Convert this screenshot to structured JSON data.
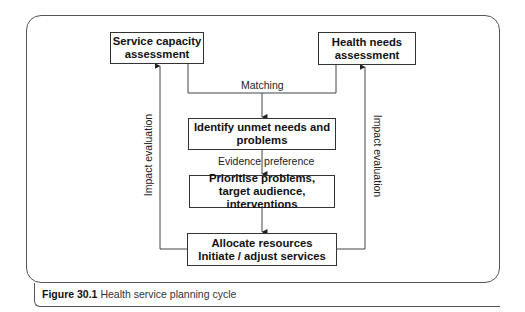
{
  "diagram": {
    "boxes": {
      "service_capacity": {
        "line1": "Service capacity",
        "line2": "assessment"
      },
      "health_needs": {
        "line1": "Health needs",
        "line2": "assessment"
      },
      "identify": {
        "line1": "Identify unmet needs and",
        "line2": "problems"
      },
      "prioritise": {
        "line1": "Prioritise problems,",
        "line2": "target audience, interventions"
      },
      "allocate": {
        "line1": "Allocate resources",
        "line2": "Initiate / adjust services"
      }
    },
    "edge_labels": {
      "matching": "Matching",
      "evidence": "Evidence preference",
      "impact_left": "Impact evaluation",
      "impact_right": "Impact evaluation"
    },
    "colors": {
      "line": "#333333",
      "frame": "#555555"
    }
  },
  "caption": {
    "number": "Figure 30.1",
    "text": "Health service planning cycle"
  }
}
